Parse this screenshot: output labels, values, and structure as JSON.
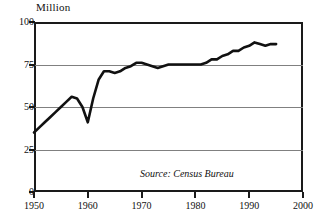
{
  "chart_data": {
    "type": "line",
    "title": "",
    "subtitle": "",
    "unit_label": "Million",
    "xlabel": "",
    "ylabel": "Million",
    "xlim": [
      1950,
      2000
    ],
    "ylim": [
      0,
      100
    ],
    "xticks": [
      1950,
      1960,
      1970,
      1980,
      1990,
      2000
    ],
    "xtick_labels": [
      "1950",
      "1960",
      "1970",
      "1980",
      "1990",
      "2000"
    ],
    "yticks": [
      0,
      25,
      50,
      75,
      100
    ],
    "ytick_labels": [
      "0",
      "25",
      "50",
      "75",
      "100"
    ],
    "grid": "horizontal",
    "legend": "none",
    "annotations": [
      "Source: Census Bureau"
    ],
    "line_color": "#111111",
    "grid_color": "#808080",
    "axis_color": "#1a1a1a",
    "series": [
      {
        "name": "Total",
        "x": [
          1950,
          1951,
          1952,
          1953,
          1954,
          1955,
          1956,
          1957,
          1958,
          1959,
          1960,
          1961,
          1962,
          1963,
          1964,
          1965,
          1966,
          1967,
          1968,
          1969,
          1970,
          1971,
          1972,
          1973,
          1974,
          1975,
          1976,
          1977,
          1978,
          1979,
          1980,
          1981,
          1982,
          1983,
          1984,
          1985,
          1986,
          1987,
          1988,
          1989,
          1990,
          1991,
          1992,
          1993,
          1994,
          1995
        ],
        "values": [
          35,
          38,
          41,
          44,
          47,
          50,
          53,
          56,
          55,
          50,
          41,
          55,
          66,
          71,
          71,
          70,
          71,
          73,
          74,
          76,
          76,
          75,
          74,
          73,
          74,
          75,
          75,
          75,
          75,
          75,
          75,
          75,
          76,
          78,
          78,
          80,
          81,
          83,
          83,
          85,
          86,
          88,
          87,
          86,
          87,
          87
        ]
      }
    ]
  },
  "source": {
    "note": "Source: Census Bureau"
  }
}
